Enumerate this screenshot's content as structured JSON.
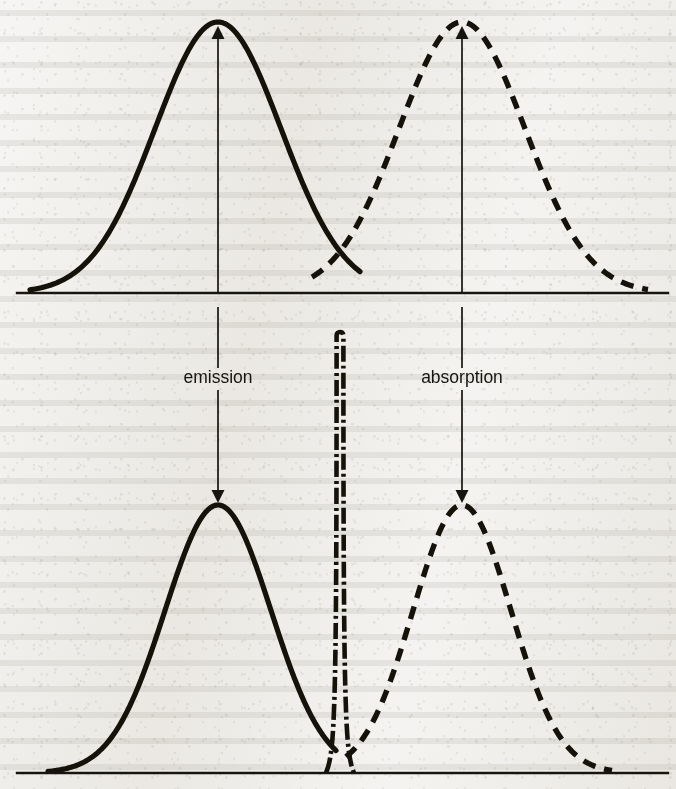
{
  "figure": {
    "background_color": "#eceae5",
    "ink_color": "#141209",
    "width": 676,
    "height": 789
  },
  "labels": {
    "emission": "emission",
    "absorption": "absorption"
  },
  "chart_data": {
    "type": "line",
    "subtitle": "",
    "xlabel": "",
    "ylabel": "",
    "grid": false,
    "legend": "none",
    "annotations": [
      {
        "text": "emission",
        "x": 218,
        "y": 378,
        "describes": "downward arrow linking the broad solid emission band (upper panel) to the narrow solid emission band (lower panel)"
      },
      {
        "text": "absorption",
        "x": 462,
        "y": 378,
        "describes": "downward arrow linking the broad dashed absorption band (upper panel) to the narrow dashed absorption band (lower panel)"
      }
    ],
    "panels": [
      {
        "name": "upper-panel",
        "description": "Broad overlapping emission and absorption bands",
        "baseline_y": 293,
        "axis_x_range": [
          17,
          668
        ],
        "series": [
          {
            "name": "emission",
            "style": "solid",
            "peak_x": 218,
            "peak_y": 22,
            "sigma": 63,
            "x_start": 30,
            "x_end": 360,
            "amplitude": 271
          },
          {
            "name": "absorption",
            "style": "dashed",
            "peak_x": 462,
            "peak_y": 22,
            "sigma": 63,
            "x_start": 312,
            "x_end": 648,
            "amplitude": 271
          }
        ],
        "crossing_point": {
          "x": 340,
          "y": 268
        },
        "arrows": [
          {
            "name": "emission-up-arrow",
            "x": 218,
            "from_y": 293,
            "to_y": 26,
            "direction": "up"
          },
          {
            "name": "absorption-up-arrow",
            "x": 462,
            "from_y": 293,
            "to_y": 26,
            "direction": "up"
          }
        ]
      },
      {
        "name": "lower-panel",
        "description": "Narrow emission and absorption bands separated by a sharp zero-phonon line",
        "baseline_y": 773,
        "axis_x_range": [
          17,
          668
        ],
        "series": [
          {
            "name": "emission",
            "style": "solid",
            "peak_x": 218,
            "peak_y": 505,
            "sigma": 53,
            "x_start": 48,
            "x_end": 336,
            "amplitude": 268
          },
          {
            "name": "zero-phonon-line",
            "style": "dash-dot",
            "peak_x": 340,
            "peak_y": 332,
            "sigma": 3,
            "x_start": 332,
            "x_end": 348,
            "amplitude": 441
          },
          {
            "name": "absorption",
            "style": "dashed",
            "peak_x": 462,
            "peak_y": 505,
            "sigma": 49,
            "x_start": 346,
            "x_end": 612,
            "amplitude": 268
          }
        ],
        "arrows": [
          {
            "name": "emission-down-arrow",
            "x": 218,
            "from_y": 293,
            "to_y": 503,
            "direction": "down"
          },
          {
            "name": "absorption-down-arrow",
            "x": 462,
            "from_y": 293,
            "to_y": 503,
            "direction": "down"
          }
        ]
      }
    ]
  }
}
